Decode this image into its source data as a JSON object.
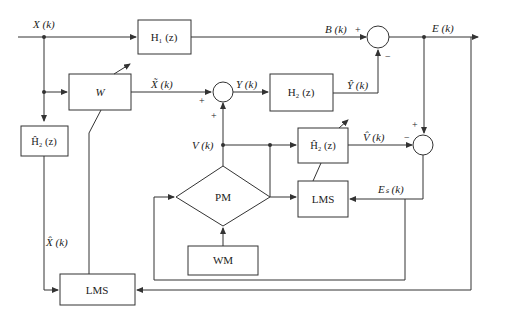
{
  "diagram": {
    "type": "block-diagram",
    "blocks": {
      "h1": "H₁ (z)",
      "w": "W",
      "h2": "H₂ (z)",
      "h2hat_left": "Ĥ₂ (z)",
      "h2hat_right": "Ĥ₂ (z)",
      "pm": "PM",
      "lms_right": "LMS",
      "wm": "WM",
      "lms_bottom": "LMS"
    },
    "signals": {
      "x": "X (k)",
      "xtilde": "X̃ (k)",
      "y": "Y (k)",
      "b": "B (k)",
      "e": "E (k)",
      "yhat": "Ŷ (k)",
      "v": "V (k)",
      "vhat": "V̂ (k)",
      "es": "Eₛ (k)",
      "xhat": "X̂ (k)"
    },
    "signs": {
      "plus": "+",
      "minus": "−"
    }
  }
}
